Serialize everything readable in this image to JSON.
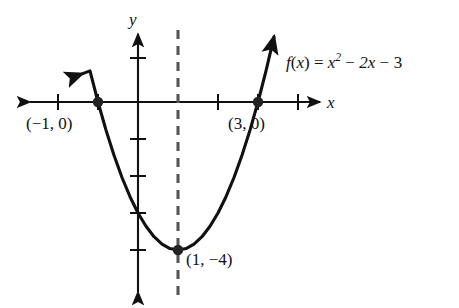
{
  "figure": {
    "kind": "cartesian-graph",
    "background_color": "#ffffff",
    "ink_color": "#111111"
  },
  "axes": {
    "x_label": "x",
    "y_label": "y",
    "origin_px": [
      138,
      102
    ],
    "x_unit_px": 40,
    "y_unit_px": 37,
    "x_tick_values": [
      -2,
      -1,
      0,
      1,
      2,
      3,
      4
    ],
    "y_tick_values": [
      1,
      -1,
      -2,
      -3,
      -4
    ]
  },
  "equation": {
    "f": "f",
    "open": "(",
    "arg": "x",
    "close": ")",
    "equals": "=",
    "term1_base": "x",
    "term1_exp": "2",
    "minus1": "−",
    "term2": "2x",
    "minus2": "−",
    "term3": "3",
    "plain": "f(x) = x² − 2x − 3"
  },
  "labels": {
    "root_left": "(−1, 0)",
    "root_right": "(3, 0)",
    "vertex": "(1, −4)"
  },
  "chart_data": {
    "type": "line",
    "title": "",
    "subtitle": "",
    "xlabel": "x",
    "ylabel": "y",
    "function": "f(x) = x^2 - 2x - 3",
    "coefficients": {
      "a": 1,
      "b": -2,
      "c": -3
    },
    "xlim": [
      -2.5,
      4.5
    ],
    "ylim": [
      -5.2,
      2.2
    ],
    "grid": false,
    "legend": null,
    "series": [
      {
        "name": "f(x) = x² − 2x − 3",
        "x": [
          -1.4,
          -1.2,
          -1.0,
          -0.8,
          -0.6,
          -0.4,
          -0.2,
          0.0,
          0.2,
          0.4,
          0.6,
          0.8,
          1.0,
          1.2,
          1.4,
          1.6,
          1.8,
          2.0,
          2.2,
          2.4,
          2.6,
          2.8,
          3.0,
          3.2,
          3.4
        ],
        "y": [
          0.76,
          0.84,
          0.0,
          -0.76,
          -1.44,
          -2.04,
          -2.56,
          -3.0,
          -3.36,
          -3.64,
          -3.84,
          -3.96,
          -4.0,
          -3.96,
          -3.84,
          -3.64,
          -3.36,
          -3.0,
          -2.56,
          -2.04,
          -1.44,
          -0.76,
          0.0,
          0.84,
          1.76
        ]
      }
    ],
    "annotated_points": [
      {
        "label": "(−1, 0)",
        "x": -1,
        "y": 0,
        "marker": "filled-circle"
      },
      {
        "label": "(3, 0)",
        "x": 3,
        "y": 0,
        "marker": "filled-circle"
      },
      {
        "label": "(1, −4)",
        "x": 1,
        "y": -4,
        "marker": "filled-circle"
      }
    ],
    "axis_of_symmetry": {
      "x": 1,
      "style": "dashed",
      "color": "#555555"
    }
  }
}
